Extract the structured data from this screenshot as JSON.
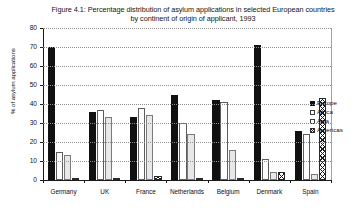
{
  "chart_data": {
    "type": "bar",
    "title": "Figure 4.1: Percentage distribution of asylum applications in selected European countries by continent of origin of applicant, 1993",
    "title_lines": [
      "Figure 4.1: Percentage distribution of asylum applications in selected European countries",
      "by continent of origin of applicant, 1993"
    ],
    "xlabel": "",
    "ylabel": "% of asylum applications",
    "ylim": [
      0,
      80
    ],
    "yticks": [
      0,
      10,
      20,
      30,
      40,
      50,
      60,
      70,
      80
    ],
    "grid": true,
    "legend_position": "right",
    "categories": [
      "Germany",
      "UK",
      "France",
      "Netherlands",
      "Belgium",
      "Denmark",
      "Spain"
    ],
    "series": [
      {
        "name": "Europe",
        "color": "#111111",
        "fill": "solid",
        "values": [
          70,
          36,
          33,
          45,
          42,
          71,
          26
        ]
      },
      {
        "name": "Africa",
        "color": "#ffffff",
        "fill": "open",
        "values": [
          15,
          37,
          38,
          30,
          41,
          11,
          24
        ]
      },
      {
        "name": "Asia",
        "color": "#e8e8e8",
        "fill": "light-grey",
        "values": [
          13,
          33,
          34,
          24,
          16,
          4,
          3
        ]
      },
      {
        "name": "Americas",
        "color": "#ffffff",
        "fill": "crosshatch",
        "values": [
          0,
          1,
          2,
          1,
          1,
          4,
          43
        ]
      }
    ]
  },
  "legend": {
    "items": [
      {
        "label": "Europe"
      },
      {
        "label": "Africa"
      },
      {
        "label": "Asia"
      },
      {
        "label": "Americas"
      }
    ]
  }
}
